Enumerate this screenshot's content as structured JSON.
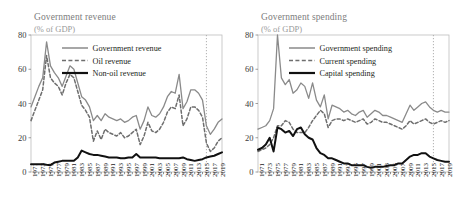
{
  "figure": {
    "width": 454,
    "height": 222,
    "background": "#ffffff"
  },
  "panels": [
    {
      "id": "revenue",
      "title": "Government revenue",
      "subtitle": "(% of GDP)",
      "legend": [
        {
          "label": "Government revenue",
          "style": "solid",
          "color": "#8a8a8a",
          "width": 1.3
        },
        {
          "label": "Oil revenue",
          "style": "dashed",
          "color": "#6e6e6e",
          "width": 1.5
        },
        {
          "label": "Non-oil revenue",
          "style": "solid",
          "color": "#111111",
          "width": 2.0
        }
      ]
    },
    {
      "id": "spending",
      "title": "Government spending",
      "subtitle": "(% of GDP)",
      "legend": [
        {
          "label": "Government spending",
          "style": "solid",
          "color": "#8a8a8a",
          "width": 1.3
        },
        {
          "label": "Current spending",
          "style": "dashed",
          "color": "#6e6e6e",
          "width": 1.5
        },
        {
          "label": "Capital spending",
          "style": "solid",
          "color": "#111111",
          "width": 2.0
        }
      ]
    }
  ],
  "axis": {
    "yticks": [
      0,
      20,
      40,
      60,
      80
    ],
    "ylim": [
      0,
      80
    ],
    "xlim": [
      1970,
      2019
    ],
    "xticks": [
      1971,
      1973,
      1975,
      1977,
      1979,
      1981,
      1983,
      1985,
      1987,
      1989,
      1991,
      1993,
      1995,
      1997,
      1999,
      2001,
      2003,
      2005,
      2007,
      2009,
      2011,
      2013,
      2015,
      2017,
      2019
    ],
    "grid": false,
    "forecast_marker_year": 2015,
    "forecast_marker_style": "dotted-vertical"
  },
  "chart_data": [
    {
      "type": "line",
      "title": "Government revenue",
      "subtitle": "(% of GDP)",
      "xlabel": "",
      "ylabel": "(% of GDP)",
      "ylim": [
        0,
        80
      ],
      "xlim": [
        1970,
        2019
      ],
      "grid": false,
      "legend_position": "top-right-inside",
      "annotations": [
        {
          "type": "vertical-dotted-line",
          "x": 2015,
          "label": ""
        }
      ],
      "x": [
        1970,
        1971,
        1972,
        1973,
        1974,
        1975,
        1976,
        1977,
        1978,
        1979,
        1980,
        1981,
        1982,
        1983,
        1984,
        1985,
        1986,
        1987,
        1988,
        1989,
        1990,
        1991,
        1992,
        1993,
        1994,
        1995,
        1996,
        1997,
        1998,
        1999,
        2000,
        2001,
        2002,
        2003,
        2004,
        2005,
        2006,
        2007,
        2008,
        2009,
        2010,
        2011,
        2012,
        2013,
        2014,
        2015,
        2016,
        2017,
        2018,
        2019
      ],
      "series": [
        {
          "name": "Government revenue",
          "style": "solid",
          "color": "#8a8a8a",
          "values": [
            38,
            44,
            50,
            55,
            76,
            62,
            58,
            55,
            50,
            56,
            62,
            60,
            52,
            44,
            42,
            38,
            30,
            33,
            30,
            34,
            32,
            31,
            30,
            31,
            29,
            30,
            32,
            33,
            25,
            30,
            38,
            33,
            32,
            34,
            38,
            44,
            47,
            46,
            57,
            37,
            41,
            48,
            48,
            46,
            42,
            27,
            22,
            25,
            29,
            31
          ]
        },
        {
          "name": "Oil revenue",
          "style": "dashed",
          "color": "#6e6e6e",
          "values": [
            30,
            36,
            42,
            48,
            68,
            55,
            52,
            50,
            45,
            52,
            57,
            55,
            47,
            39,
            36,
            32,
            18,
            24,
            19,
            25,
            23,
            22,
            21,
            23,
            20,
            21,
            23,
            25,
            16,
            21,
            29,
            24,
            23,
            25,
            29,
            35,
            38,
            37,
            45,
            27,
            31,
            38,
            38,
            36,
            32,
            17,
            12,
            14,
            18,
            20
          ]
        },
        {
          "name": "Non-oil revenue",
          "style": "solid",
          "color": "#111111",
          "values": [
            4.5,
            4.5,
            4.5,
            4.5,
            4.2,
            4.0,
            5.5,
            6.0,
            6.5,
            6.5,
            6.5,
            6.5,
            8.5,
            12.5,
            11.5,
            10.5,
            10.0,
            10.0,
            9.5,
            9.0,
            8.5,
            8.5,
            8.5,
            8.0,
            8.0,
            8.5,
            8.5,
            10.5,
            8.5,
            8.5,
            8.5,
            8.5,
            8.5,
            8.0,
            8.0,
            8.0,
            8.0,
            8.0,
            8.0,
            8.5,
            7.5,
            7.0,
            6.5,
            7.0,
            7.5,
            8.5,
            9.0,
            9.5,
            10.5,
            11.5
          ]
        }
      ]
    },
    {
      "type": "line",
      "title": "Government spending",
      "subtitle": "(% of GDP)",
      "xlabel": "",
      "ylabel": "(% of GDP)",
      "ylim": [
        0,
        80
      ],
      "xlim": [
        1970,
        2019
      ],
      "grid": false,
      "legend_position": "top-right-inside",
      "annotations": [
        {
          "type": "vertical-dotted-line",
          "x": 2015,
          "label": ""
        }
      ],
      "x": [
        1970,
        1971,
        1972,
        1973,
        1974,
        1975,
        1976,
        1977,
        1978,
        1979,
        1980,
        1981,
        1982,
        1983,
        1984,
        1985,
        1986,
        1987,
        1988,
        1989,
        1990,
        1991,
        1992,
        1993,
        1994,
        1995,
        1996,
        1997,
        1998,
        1999,
        2000,
        2001,
        2002,
        2003,
        2004,
        2005,
        2006,
        2007,
        2008,
        2009,
        2010,
        2011,
        2012,
        2013,
        2014,
        2015,
        2016,
        2017,
        2018,
        2019
      ],
      "series": [
        {
          "name": "Government spending",
          "style": "solid",
          "color": "#8a8a8a",
          "values": [
            25,
            26,
            27,
            30,
            37,
            80,
            55,
            51,
            54,
            46,
            48,
            52,
            50,
            43,
            52,
            42,
            38,
            45,
            31,
            39,
            38,
            37,
            35,
            36,
            34,
            33,
            35,
            36,
            32,
            34,
            36,
            35,
            33,
            33,
            32,
            31,
            30,
            29,
            34,
            39,
            36,
            38,
            40,
            41,
            38,
            36,
            35,
            36,
            35,
            35
          ]
        },
        {
          "name": "Current spending",
          "style": "dashed",
          "color": "#6e6e6e",
          "values": [
            12,
            13,
            14,
            16,
            20,
            27,
            27,
            30,
            29,
            25,
            23,
            23,
            23,
            26,
            30,
            33,
            36,
            34,
            26,
            30,
            31,
            31,
            30,
            31,
            30,
            29,
            30,
            31,
            28,
            29,
            31,
            30,
            29,
            29,
            28,
            27,
            26,
            25,
            27,
            30,
            28,
            29,
            30,
            31,
            29,
            28,
            29,
            30,
            29,
            30
          ]
        },
        {
          "name": "Capital spending",
          "style": "solid",
          "color": "#111111",
          "values": [
            13,
            14,
            16,
            20,
            12,
            26,
            25,
            23,
            24,
            21,
            25,
            26,
            22,
            20,
            19,
            14,
            11,
            10,
            8,
            8,
            7,
            6,
            5,
            5,
            4,
            4,
            4,
            4,
            3,
            2.5,
            3,
            3,
            3,
            3.5,
            4,
            4,
            5,
            5,
            7,
            9,
            10,
            10,
            11,
            11,
            9,
            8,
            7,
            6.5,
            6,
            6
          ]
        }
      ]
    }
  ]
}
